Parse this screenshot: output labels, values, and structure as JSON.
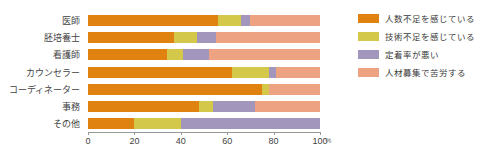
{
  "chart_data": {
    "type": "bar",
    "orientation": "horizontal",
    "stacked": true,
    "stack_mode": "percent",
    "title": "",
    "subtitle": "",
    "xlabel": "%",
    "ylabel": "",
    "xlim": [
      0,
      100
    ],
    "xticks": [
      0,
      20,
      40,
      60,
      80,
      100
    ],
    "xtick_labels": [
      "0",
      "20",
      "40",
      "60",
      "80",
      "100"
    ],
    "grid": false,
    "legend_position": "right",
    "categories": [
      "医師",
      "胚培養士",
      "看護師",
      "カウンセラー",
      "コーディネーター",
      "事務",
      "その他"
    ],
    "series": [
      {
        "name": "人数不足を感じている",
        "color": "#e0820f",
        "values": [
          56,
          37,
          34,
          62,
          75,
          48,
          20
        ]
      },
      {
        "name": "技術不足を感じている",
        "color": "#d4c84b",
        "values": [
          10,
          10,
          7,
          16,
          3,
          6,
          20
        ]
      },
      {
        "name": "定着率が悪い",
        "color": "#a396bd",
        "values": [
          4,
          8,
          11,
          3,
          0,
          18,
          60
        ]
      },
      {
        "name": "人材募集で苦労する",
        "color": "#eda382",
        "values": [
          30,
          45,
          48,
          19,
          22,
          28,
          0
        ]
      }
    ]
  },
  "axis": {
    "unit": "%"
  }
}
